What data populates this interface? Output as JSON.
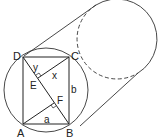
{
  "diagram": {
    "points": {
      "A": {
        "label": "A",
        "x": 23,
        "y": 124
      },
      "B": {
        "label": "B",
        "x": 69,
        "y": 124
      },
      "C": {
        "label": "C",
        "x": 69,
        "y": 57
      },
      "D": {
        "label": "D",
        "x": 23,
        "y": 57
      },
      "E": {
        "label": "E",
        "x": 38,
        "y": 78
      },
      "F": {
        "label": "F",
        "x": 54,
        "y": 104
      }
    },
    "segment_labels": {
      "y": "y",
      "x": "x",
      "b": "b",
      "a": "a"
    },
    "colors": {
      "stroke": "#222222",
      "background": "#ffffff"
    }
  }
}
